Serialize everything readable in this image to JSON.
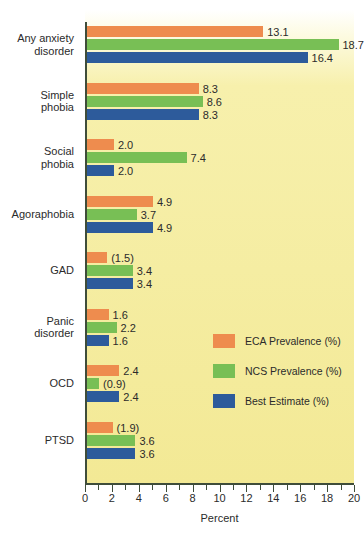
{
  "chart_data": {
    "type": "bar",
    "orientation": "horizontal",
    "title": "",
    "xlabel": "Percent",
    "ylabel": "",
    "xlim": [
      0,
      20
    ],
    "xticks": [
      0,
      2,
      4,
      6,
      8,
      10,
      12,
      14,
      16,
      18,
      20
    ],
    "xtick_labels": [
      "0",
      "2",
      "4",
      "6",
      "8",
      "10",
      "12",
      "14",
      "16",
      "18",
      "20"
    ],
    "minor_tick_step": 1,
    "grid": false,
    "legend_position": "center-right",
    "categories": [
      "Any anxiety\ndisorder",
      "Simple\nphobia",
      "Social\nphobia",
      "Agoraphobia",
      "GAD",
      "Panic\ndisorder",
      "OCD",
      "PTSD"
    ],
    "series": [
      {
        "name": "ECA Prevalence (%)",
        "color": "#ee8c4e",
        "values": [
          13.1,
          8.3,
          2.0,
          4.9,
          1.5,
          1.6,
          2.4,
          1.9
        ],
        "labels": [
          "13.1",
          "8.3",
          "2.0",
          "4.9",
          "(1.5)",
          "1.6",
          "2.4",
          "(1.9)"
        ]
      },
      {
        "name": "NCS Prevalence (%)",
        "color": "#78bf55",
        "values": [
          18.7,
          8.6,
          7.4,
          3.7,
          3.4,
          2.2,
          0.9,
          3.6
        ],
        "labels": [
          "18.7",
          "8.6",
          "7.4",
          "3.7",
          "3.4",
          "2.2",
          "(0.9)",
          "3.6"
        ]
      },
      {
        "name": "Best Estimate (%)",
        "color": "#2d5b9b",
        "values": [
          16.4,
          8.3,
          2.0,
          4.9,
          3.4,
          1.6,
          2.4,
          3.6
        ],
        "labels": [
          "16.4",
          "8.3",
          "2.0",
          "4.9",
          "3.4",
          "1.6",
          "2.4",
          "3.6"
        ]
      }
    ]
  },
  "legend": {
    "items": [
      {
        "label": "ECA Prevalence (%)",
        "key": "eca"
      },
      {
        "label": "NCS Prevalence (%)",
        "key": "ncs"
      },
      {
        "label": "Best Estimate (%)",
        "key": "best"
      }
    ]
  },
  "colors": {
    "eca": "#ee8c4e",
    "ncs": "#78bf55",
    "best": "#2d5b9b",
    "plot_background_top": "#ffffff",
    "plot_background_bottom": "#f3e995",
    "axis": "#3f4d3a",
    "text": "#2b2b2b"
  }
}
